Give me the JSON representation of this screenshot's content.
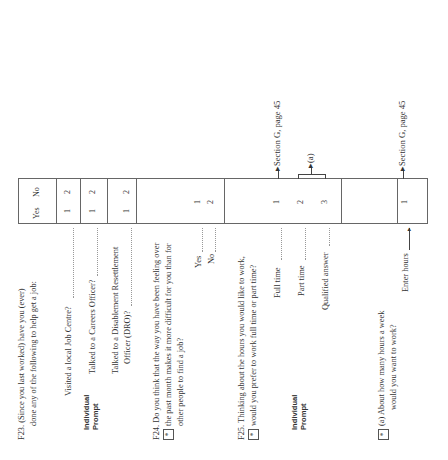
{
  "orientation": "rotated-90-ccw",
  "header": {
    "yes": "Yes",
    "no": "No"
  },
  "f23": {
    "number": "F23.",
    "text1": "(Since you last worked) have you (ever)",
    "text2": "done any of the following to help get a job:",
    "prompt": [
      "Individual",
      "Prompt"
    ],
    "items": [
      {
        "label": "Visited a local Job Centre?",
        "yes": "1",
        "no": "2"
      },
      {
        "label": "Talked to a Careers Officer?",
        "yes": "1",
        "no": "2"
      },
      {
        "label1": "Talked to a Disablement Resettlement",
        "label2": "Officer (DRO)?",
        "yes": "1",
        "no": "2"
      }
    ]
  },
  "f24": {
    "number": "F24.",
    "star": "*",
    "text1": "Do you think that the way you have been feeling over",
    "text2": "the past month makes it more difficult for you than for",
    "text3": "other people to find a job?",
    "options": [
      {
        "label": "Yes",
        "code": "1"
      },
      {
        "label": "No",
        "code": "2"
      }
    ]
  },
  "f25": {
    "number": "F25.",
    "star": "*",
    "text1": "Thinking about the hours you would like to work,",
    "text2": "would you prefer to work full time or part time?",
    "prompt": [
      "Individual",
      "Prompt"
    ],
    "options": [
      {
        "label": "Full time",
        "code": "1",
        "route": "Section G, page 45"
      },
      {
        "label": "Part time",
        "code": "2"
      },
      {
        "label": "Qualified answer",
        "code": "3"
      }
    ],
    "route_a": "(a)"
  },
  "f25a": {
    "star": "*",
    "letter": "(a)",
    "text1": "About how many hours a week",
    "text2": "would you want to work?",
    "enter_label": "Enter hours",
    "code": "1",
    "route": "Section G, page 45"
  }
}
